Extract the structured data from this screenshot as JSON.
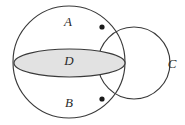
{
  "figure": {
    "background_color": "#ffffff",
    "stroke_color": "#3a3a3a",
    "disk_fill_color": "#e2e2e2",
    "dot_color": "#1a1a1a",
    "labels": {
      "upper_cap": "A",
      "disk": "D",
      "lower_cap": "B",
      "side_circle": "C"
    },
    "geometry": {
      "sphere": {
        "cx": 69,
        "cy": 62,
        "r": 56
      },
      "disk": {
        "cx": 69.5,
        "cy": 63,
        "rx": 55.5,
        "ry": 14
      },
      "side_circle": {
        "cx": 134,
        "cy": 63,
        "r": 36
      },
      "upper_intersection_dot": {
        "cx": 102,
        "cy": 27,
        "r": 2.6
      },
      "lower_intersection_dot": {
        "cx": 102,
        "cy": 99,
        "r": 2.6
      }
    },
    "label_positions": {
      "upper_cap": {
        "x": 68,
        "y": 23
      },
      "disk": {
        "x": 69,
        "y": 62
      },
      "lower_cap": {
        "x": 69,
        "y": 104
      },
      "side_circle": {
        "x": 172,
        "y": 65
      }
    }
  }
}
